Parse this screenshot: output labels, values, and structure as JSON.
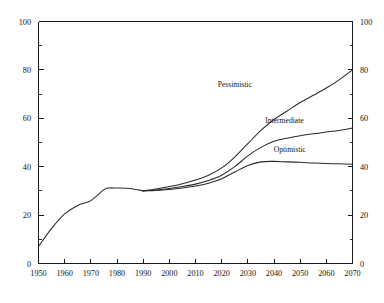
{
  "chart_data": {
    "type": "line",
    "title": "",
    "subtitle": "",
    "xlabel": "",
    "ylabel": "",
    "xlim": [
      1950,
      2070
    ],
    "ylim": [
      0,
      100
    ],
    "grid": false,
    "legend_position": "inline-annotations",
    "dual_y_axis": true,
    "x_ticks": [
      1950,
      1960,
      1970,
      1980,
      1990,
      2000,
      2010,
      2020,
      2030,
      2040,
      2050,
      2060,
      2070
    ],
    "x_tick_labels": [
      "1950",
      "1960",
      "1970",
      "1980",
      "1990",
      "2000",
      "2010",
      "2020",
      "2030",
      "2040",
      "2050",
      "2060",
      "2070"
    ],
    "y_ticks_major": [
      0,
      20,
      40,
      60,
      80,
      100
    ],
    "y_tick_labels_left": [
      "0",
      "20",
      "40",
      "60",
      "80",
      "100"
    ],
    "y_tick_labels_right": [
      "0",
      "20",
      "40",
      "60",
      "80",
      "100"
    ],
    "y_ticks_minor": [
      10,
      30,
      50,
      70,
      90
    ],
    "series": [
      {
        "name": "Historical",
        "label": "",
        "x": [
          1950,
          1955,
          1960,
          1965,
          1970,
          1975,
          1977,
          1980,
          1985,
          1990
        ],
        "values": [
          7.0,
          14.5,
          20.5,
          24.0,
          26.0,
          30.5,
          31.2,
          31.2,
          31.0,
          30.0
        ]
      },
      {
        "name": "Pessimistic",
        "label": "Pessimistic",
        "x": [
          1990,
          1995,
          2000,
          2005,
          2010,
          2015,
          2020,
          2025,
          2030,
          2035,
          2040,
          2045,
          2050,
          2055,
          2060,
          2065,
          2070
        ],
        "values": [
          30.0,
          30.8,
          31.8,
          33.0,
          34.5,
          36.5,
          39.5,
          44.0,
          49.5,
          55.0,
          59.5,
          63.0,
          66.5,
          69.5,
          72.5,
          76.0,
          80.0
        ]
      },
      {
        "name": "Intermediate",
        "label": "Intermediate",
        "x": [
          1990,
          1995,
          2000,
          2005,
          2010,
          2015,
          2020,
          2025,
          2030,
          2035,
          2040,
          2045,
          2050,
          2055,
          2060,
          2065,
          2070
        ],
        "values": [
          30.0,
          30.4,
          31.0,
          31.8,
          32.8,
          34.3,
          36.5,
          40.0,
          44.5,
          48.0,
          50.5,
          51.8,
          52.8,
          53.6,
          54.3,
          55.0,
          56.0
        ]
      },
      {
        "name": "Optimistic",
        "label": "Optimistic",
        "x": [
          1990,
          1995,
          2000,
          2005,
          2010,
          2015,
          2020,
          2025,
          2030,
          2035,
          2040,
          2045,
          2050,
          2055,
          2060,
          2065,
          2070
        ],
        "values": [
          30.0,
          30.2,
          30.6,
          31.2,
          32.0,
          33.2,
          35.0,
          37.8,
          40.5,
          42.0,
          42.2,
          42.0,
          41.8,
          41.5,
          41.3,
          41.2,
          41.0
        ]
      }
    ],
    "annotations": [
      {
        "text": "Pessimistic",
        "x": 2025,
        "y": 73
      },
      {
        "text": "Intermediate",
        "x": 2044,
        "y": 58
      },
      {
        "text": "Optimistic",
        "x": 2046,
        "y": 46
      }
    ],
    "colors": {
      "line": "#2a2a2a",
      "axis": "#1a1a1a",
      "background": "#ffffff"
    }
  }
}
